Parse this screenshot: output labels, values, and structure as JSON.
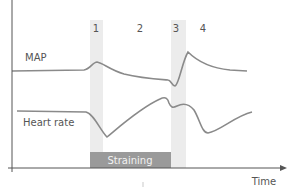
{
  "diagram": {
    "title": "",
    "phases": [
      {
        "label": "1",
        "shaded": true
      },
      {
        "label": "2",
        "shaded": false
      },
      {
        "label": "3",
        "shaded": true
      },
      {
        "label": "4",
        "shaded": false
      }
    ],
    "series": [
      {
        "name": "MAP",
        "label": "MAP"
      },
      {
        "name": "heart-rate",
        "label": "Heart rate"
      }
    ],
    "straining_label": "Straining",
    "x_axis_label": "Time",
    "colors": {
      "curve": "#8a8a8a",
      "band": "#ececec",
      "straining_bar": "#9a9a9a",
      "axis": "#555555",
      "text": "#555555"
    }
  }
}
